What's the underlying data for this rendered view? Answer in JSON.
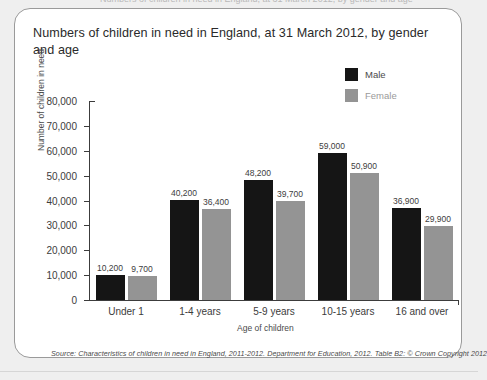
{
  "card": {
    "top_sliver_text": "Numbers of children in need in England, at 31 March 2012, by gender and age"
  },
  "source_note": "Source: Characteristics of children in need in England, 2011-2012. Department for Education, 2012. Table B2: © Crown Copyright 2012",
  "colors": {
    "male": "#151515",
    "female": "#949494",
    "axis": "#3c3c3c",
    "card_border": "#9a9a9a",
    "page_background": "#efefef"
  },
  "chart_data": {
    "type": "bar",
    "title": "Numbers of children in need in England, at 31 March 2012, by gender and age",
    "xlabel": "Age of children",
    "ylabel": "Number of children in need",
    "categories": [
      "Under 1",
      "1-4 years",
      "5-9 years",
      "10-15 years",
      "16 and over"
    ],
    "series": [
      {
        "name": "Male",
        "color": "#151515",
        "values": [
          10200,
          40200,
          48200,
          59000,
          36900
        ],
        "labels": [
          "10,200",
          "40,200",
          "48,200",
          "59,000",
          "36,900"
        ]
      },
      {
        "name": "Female",
        "color": "#949494",
        "values": [
          9700,
          36400,
          39700,
          50900,
          29900
        ],
        "labels": [
          "9,700",
          "36,400",
          "39,700",
          "50,900",
          "29,900"
        ]
      }
    ],
    "ylim": [
      0,
      80000
    ],
    "yticks": [
      0,
      10000,
      20000,
      30000,
      40000,
      50000,
      60000,
      70000,
      80000
    ],
    "ytick_labels": [
      "0",
      "10,000",
      "20,000",
      "30,000",
      "40,000",
      "50,000",
      "60,000",
      "70,000",
      "80,000"
    ],
    "grid": false,
    "legend_position": "top-right",
    "data_labels": true
  }
}
